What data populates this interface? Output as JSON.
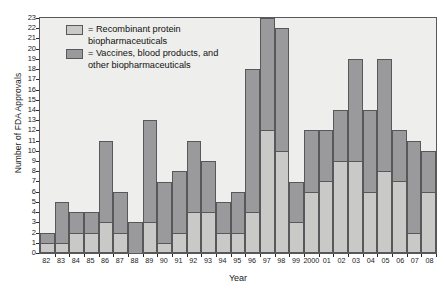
{
  "chart_data": {
    "type": "bar",
    "title": "",
    "xlabel": "Year",
    "ylabel": "Number of FDA Approvals",
    "ylim": [
      0,
      23
    ],
    "ytick_step": 1,
    "grid": false,
    "stacked": true,
    "legend_position": "top-left",
    "colors": {
      "recombinant": "#c9c9c7",
      "vaccines": "#9a9a9c",
      "plot_background": "#eeeeec",
      "axis": "#58585a"
    },
    "categories": [
      "82",
      "83",
      "84",
      "85",
      "86",
      "87",
      "88",
      "89",
      "90",
      "91",
      "92",
      "93",
      "94",
      "95",
      "96",
      "97",
      "98",
      "99",
      "2000",
      "01",
      "02",
      "03",
      "04",
      "05",
      "06",
      "07",
      "08"
    ],
    "yticks": [
      "0",
      "1",
      "2",
      "3",
      "4",
      "5",
      "6",
      "7",
      "8",
      "9",
      "10",
      "11",
      "12",
      "13",
      "14",
      "15",
      "16",
      "17",
      "18",
      "19",
      "20",
      "21",
      "22",
      "23"
    ],
    "series": [
      {
        "name": "Recombinant protein biopharmaceuticals",
        "legend_label": "= Recombinant protein\nbiopharmaceuticals",
        "swatch": "light",
        "values": [
          1,
          1,
          2,
          2,
          3,
          2,
          0,
          3,
          1,
          2,
          4,
          4,
          2,
          2,
          4,
          12,
          10,
          3,
          6,
          7,
          9,
          9,
          6,
          8,
          7,
          2,
          6
        ]
      },
      {
        "name": "Vaccines, blood products, and other biopharmaceuticals",
        "legend_label": "= Vaccines, blood products, and\nother biopharmaceuticals",
        "swatch": "dark",
        "values": [
          1,
          4,
          2,
          2,
          8,
          4,
          3,
          10,
          6,
          6,
          7,
          5,
          3,
          4,
          14,
          11,
          12,
          4,
          6,
          5,
          5,
          10,
          8,
          11,
          5,
          9,
          4
        ]
      }
    ],
    "totals": [
      2,
      5,
      4,
      4,
      11,
      6,
      3,
      13,
      7,
      8,
      11,
      9,
      5,
      6,
      18,
      23,
      22,
      7,
      12,
      12,
      14,
      19,
      14,
      19,
      12,
      11,
      10
    ]
  }
}
